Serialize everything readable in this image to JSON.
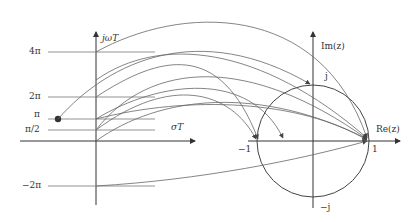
{
  "s_plane": {
    "vertical_axis_label": "jωT",
    "horizontal_axis_label": "σT",
    "ticks": [
      {
        "label": "4π",
        "y": 52
      },
      {
        "label": "2π",
        "y": 97
      },
      {
        "label": "π",
        "y": 119
      },
      {
        "label": "π/2",
        "y": 130
      },
      {
        "label": "−2π",
        "y": 186
      }
    ]
  },
  "z_plane": {
    "im_axis_label": "Im(z)",
    "re_axis_label": "Re(z)",
    "point_labels": {
      "j": "j",
      "minus_j": "−j",
      "minus_one": "−1",
      "one": "1"
    }
  },
  "colors": {
    "line": "#555555",
    "axis": "#333333",
    "circle": "#444444"
  }
}
